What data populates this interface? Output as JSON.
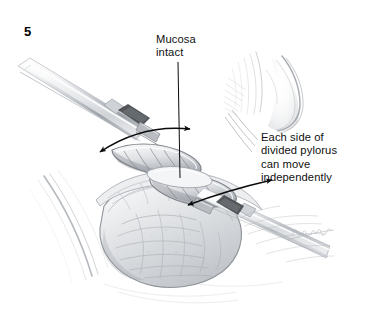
{
  "figure": {
    "number": "5",
    "domain_kind": "surgical-illustration",
    "background_color": "#ffffff",
    "ink_color": "#101010",
    "pencil_tone": "#8d9096",
    "caption_font_px": 11.2
  },
  "labels": {
    "mucosa": {
      "text": "Mucosa\nintact",
      "lines": [
        "Mucosa",
        "intact"
      ],
      "x": 156,
      "y": 33
    },
    "each_side": {
      "text": "Each side of\ndivided pylorus\ncan move\nindependently",
      "lines": [
        "Each side of",
        "divided pylorus",
        "can move",
        "independently"
      ],
      "x": 261,
      "y": 131
    }
  },
  "leaders": {
    "mucosa_leader": {
      "x1": 178,
      "y1": 62,
      "x2": 180,
      "y2": 178
    },
    "each_side_leader": {
      "x1": 258,
      "y1": 140,
      "x2": 232,
      "y2": 112
    }
  },
  "arrows": {
    "upper_motion": {
      "label": "upper divided pylorus edge motion",
      "start_x": 100,
      "start_y": 152,
      "ctrl_x": 142,
      "ctrl_y": 126,
      "end_x": 190,
      "end_y": 129,
      "double_headed": true
    },
    "lower_motion": {
      "label": "lower divided pylorus edge motion",
      "start_x": 188,
      "start_y": 205,
      "ctrl_x": 228,
      "ctrl_y": 190,
      "end_x": 272,
      "end_y": 180,
      "double_headed": true
    }
  },
  "signature": {
    "text": "artist signature",
    "x": 296,
    "y": 232
  },
  "scene": {
    "instruments": [
      {
        "name": "upper-grasper",
        "angle_deg": 28,
        "tip_x": 150,
        "tip_y": 140
      },
      {
        "name": "lower-grasper",
        "angle_deg": -20,
        "tip_x": 196,
        "tip_y": 214
      }
    ],
    "anatomy": [
      {
        "name": "duodenum"
      },
      {
        "name": "divided-pylorus-upper-edge"
      },
      {
        "name": "divided-pylorus-lower-edge"
      },
      {
        "name": "intact-mucosa"
      },
      {
        "name": "stomach-antrum"
      },
      {
        "name": "liver-edge"
      }
    ]
  }
}
